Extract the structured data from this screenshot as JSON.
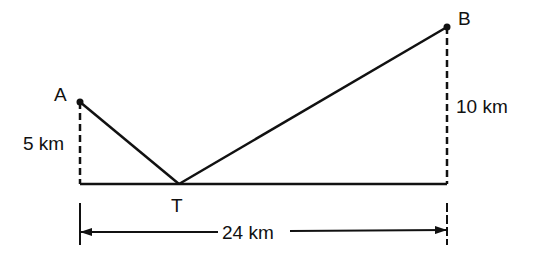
{
  "diagram": {
    "points": {
      "A": {
        "label": "A",
        "x": 80,
        "y": 102
      },
      "B": {
        "label": "B",
        "x": 447,
        "y": 27
      },
      "T": {
        "label": "T",
        "x": 179,
        "y": 184
      }
    },
    "base": {
      "x1": 80,
      "x2": 447,
      "y": 184
    },
    "heights": {
      "A": {
        "label": "5 km"
      },
      "B": {
        "label": "10 km"
      }
    },
    "span": {
      "label": "24 km",
      "y": 232
    },
    "colors": {
      "stroke": "#111111",
      "background": "#ffffff"
    }
  }
}
